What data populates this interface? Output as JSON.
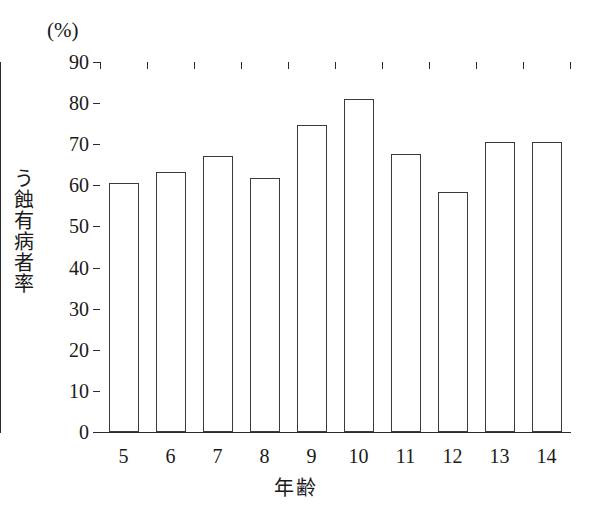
{
  "figure": {
    "unit_label": "(%)",
    "y_axis_title": "う蝕有病者率",
    "x_axis_title": "年齢",
    "line_color": "#2b2b2b",
    "bar_fill_color": "#ffffff",
    "bar_border_color": "#3a3a3a",
    "background_color": "#ffffff"
  },
  "chart_data": {
    "type": "bar",
    "title": "",
    "subtitle": "",
    "xlabel": "年齢",
    "ylabel": "う蝕有病者率",
    "unit": "(%)",
    "categories": [
      "5",
      "6",
      "7",
      "8",
      "9",
      "10",
      "11",
      "12",
      "13",
      "14"
    ],
    "values": [
      60.5,
      63.3,
      67.2,
      61.8,
      74.8,
      81.0,
      67.7,
      58.3,
      70.6,
      70.6
    ],
    "series": [
      {
        "name": "う蝕有病者率",
        "values": [
          60.5,
          63.3,
          67.2,
          61.8,
          74.8,
          81.0,
          67.7,
          58.3,
          70.6,
          70.6
        ]
      }
    ],
    "ylim": [
      0,
      90
    ],
    "xlim": [
      0,
      10
    ],
    "y_ticks": [
      0,
      10,
      20,
      30,
      40,
      50,
      60,
      70,
      80,
      90
    ],
    "y_tick_labels": [
      "0",
      "10",
      "20",
      "30",
      "40",
      "50",
      "60",
      "70",
      "80",
      "90"
    ],
    "grid": false,
    "legend": false,
    "legend_position": "none"
  }
}
